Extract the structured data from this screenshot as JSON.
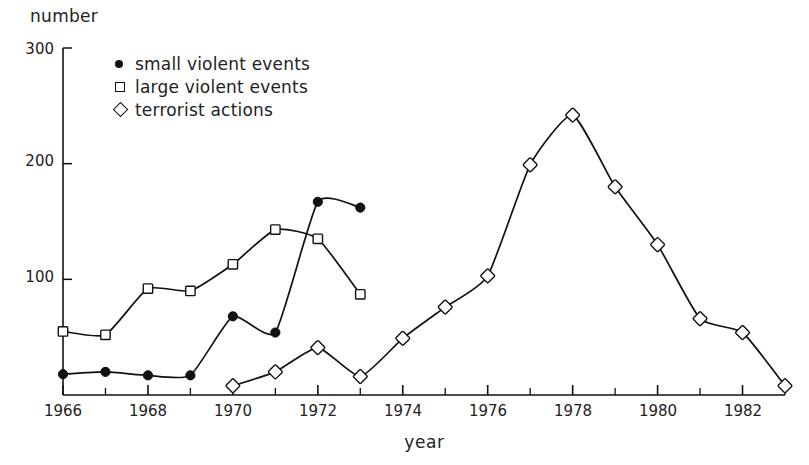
{
  "chart_data": {
    "type": "line",
    "title": "",
    "xlabel": "year",
    "ylabel": "number",
    "xlim": [
      1966,
      1983
    ],
    "ylim": [
      0,
      300
    ],
    "grid": false,
    "legend_position": "upper-left-inside",
    "y_ticks": [
      100,
      200,
      300
    ],
    "x_ticks": [
      1966,
      1967,
      1968,
      1969,
      1970,
      1971,
      1972,
      1973,
      1974,
      1975,
      1976,
      1977,
      1978,
      1979,
      1980,
      1981,
      1982,
      1983
    ],
    "x_tick_labels": [
      "1966",
      "",
      "1968",
      "",
      "1970",
      "",
      "1972",
      "",
      "1974",
      "",
      "1976",
      "",
      "1978",
      "",
      "1980",
      "",
      "1982",
      ""
    ],
    "series": [
      {
        "name": "small violent events",
        "marker": "filled-circle",
        "x": [
          1966,
          1967,
          1968,
          1969,
          1970,
          1971,
          1972,
          1973
        ],
        "values": [
          18,
          20,
          17,
          17,
          68,
          54,
          167,
          162
        ]
      },
      {
        "name": "large violent events",
        "marker": "open-square",
        "x": [
          1966,
          1967,
          1968,
          1969,
          1970,
          1971,
          1972,
          1973
        ],
        "values": [
          55,
          52,
          92,
          90,
          113,
          143,
          135,
          87
        ]
      },
      {
        "name": "terrorist actions",
        "marker": "open-diamond",
        "x": [
          1970,
          1971,
          1972,
          1973,
          1974,
          1975,
          1976,
          1977,
          1978,
          1979,
          1980,
          1981,
          1982,
          1983
        ],
        "values": [
          8,
          20,
          41,
          16,
          49,
          76,
          103,
          199,
          242,
          180,
          130,
          66,
          54,
          8
        ]
      }
    ]
  },
  "legend": {
    "items": [
      {
        "label": "small violent events",
        "marker": "filled-circle"
      },
      {
        "label": "large violent events",
        "marker": "open-square"
      },
      {
        "label": "terrorist actions",
        "marker": "open-diamond"
      }
    ]
  },
  "axis": {
    "y_title": "number",
    "x_title": "year",
    "y_tick_labels": [
      "300",
      "200",
      "100"
    ],
    "x_tick_labels": [
      "1966",
      "1968",
      "1970",
      "1972",
      "1974",
      "1976",
      "1978",
      "1980",
      "1982"
    ]
  },
  "colors": {
    "ink": "#111111",
    "background": "#ffffff"
  }
}
